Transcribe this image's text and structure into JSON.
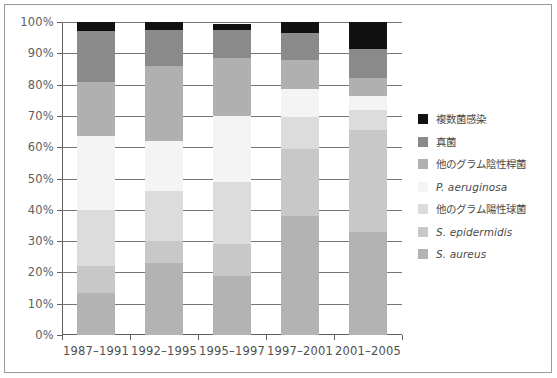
{
  "chart_data": {
    "type": "bar",
    "stacked": true,
    "normalized_percent": true,
    "title": "",
    "xlabel": "",
    "ylabel": "",
    "ylim": [
      0,
      100
    ],
    "ytick_labels": [
      "0%",
      "10%",
      "20%",
      "30%",
      "40%",
      "50%",
      "60%",
      "70%",
      "80%",
      "90%",
      "100%"
    ],
    "ytick_values": [
      0,
      10,
      20,
      30,
      40,
      50,
      60,
      70,
      80,
      90,
      100
    ],
    "grid": true,
    "legend_position": "right",
    "categories": [
      "1987–1991",
      "1992–1995",
      "1995–1997",
      "1997–2001",
      "2001–2005"
    ],
    "series": [
      {
        "name": "S. aureus",
        "italic": true,
        "color": "#b3b3b3",
        "values": [
          13.5,
          23.0,
          19.0,
          38.0,
          33.0
        ]
      },
      {
        "name": "S. epidermidis",
        "italic": true,
        "color": "#c8c8c8",
        "values": [
          8.5,
          7.0,
          10.0,
          21.5,
          32.5
        ]
      },
      {
        "name": "他のグラム陽性球菌",
        "italic": false,
        "color": "#dcdcdc",
        "values": [
          18.0,
          16.0,
          20.0,
          10.0,
          6.5
        ]
      },
      {
        "name": "P. aeruginosa",
        "italic": true,
        "color": "#f4f4f4",
        "values": [
          23.5,
          16.0,
          21.0,
          9.0,
          4.5
        ]
      },
      {
        "name": "他のグラム陰性桿菌",
        "italic": false,
        "color": "#b0b0b0",
        "values": [
          17.5,
          24.0,
          18.5,
          9.5,
          5.5
        ]
      },
      {
        "name": "真菌",
        "italic": false,
        "color": "#8a8a8a",
        "values": [
          16.0,
          11.5,
          9.0,
          8.5,
          9.5
        ]
      },
      {
        "name": "複数菌感染",
        "italic": false,
        "color": "#111111",
        "values": [
          3.0,
          2.5,
          2.0,
          3.5,
          8.5
        ]
      }
    ],
    "legend_entries": [
      {
        "label": "複数菌感染",
        "color": "#111111",
        "italic": false
      },
      {
        "label": "真菌",
        "color": "#8a8a8a",
        "italic": false
      },
      {
        "label": "他のグラム陰性桿菌",
        "color": "#b0b0b0",
        "italic": false
      },
      {
        "label": "P. aeruginosa",
        "color": "#f4f4f4",
        "italic": true
      },
      {
        "label": "他のグラム陽性球菌",
        "color": "#dcdcdc",
        "italic": false
      },
      {
        "label": "S. epidermidis",
        "color": "#c8c8c8",
        "italic": true
      },
      {
        "label": "S. aureus",
        "color": "#b3b3b3",
        "italic": true
      }
    ],
    "colors": {
      "axis": "#5f5f5f",
      "gridline": "#757575",
      "frame": "#9a9a9a",
      "text": "#4a4a4a",
      "background": "#ffffff"
    }
  }
}
